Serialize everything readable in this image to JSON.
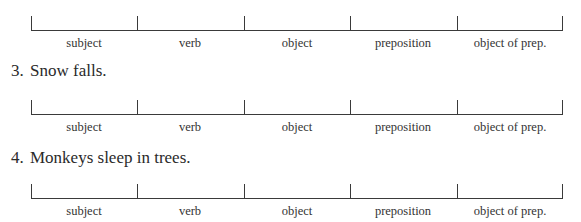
{
  "diagram_labels": [
    "subject",
    "verb",
    "object",
    "preposition",
    "object of prep."
  ],
  "exercises": [
    {
      "number": "3.",
      "sentence": "Snow falls."
    },
    {
      "number": "4.",
      "sentence": "Monkeys sleep in trees."
    }
  ]
}
